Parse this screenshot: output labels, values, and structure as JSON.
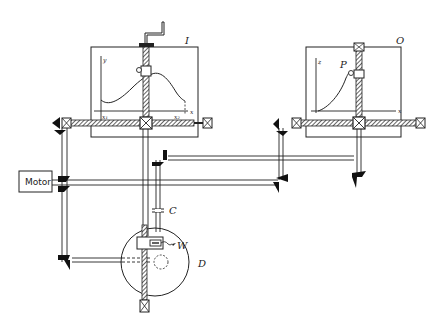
{
  "diagram": {
    "labels": {
      "input_table": "I",
      "output_table": "O",
      "pointer": "P",
      "clutch": "C",
      "wheel": "W",
      "disc": "D",
      "motor": "Motor"
    },
    "input_table_axes": {
      "y_axis": "y",
      "x_axis": "x",
      "x_start": "x₁",
      "x_end": "x₂"
    },
    "output_table_axes": {
      "y_axis": "z",
      "x_axis": "x"
    },
    "colors": {
      "line": "#222222",
      "background": "#ffffff",
      "gear_fill": "#111111"
    }
  }
}
